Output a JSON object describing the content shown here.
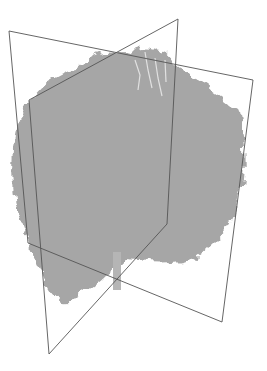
{
  "scene": {
    "description": "3D volume rendering of a tree canopy point cloud with two orthogonal intersecting slice planes",
    "background": "#ffffff",
    "foliage_color": "#9a9a9a",
    "foliage_light": "#d4d4d4",
    "foliage_dark": "#6e6e6e",
    "plane_stroke": "#555555",
    "planes": [
      {
        "name": "plane-a",
        "corners": [
          [
            9,
            31
          ],
          [
            253,
            80
          ],
          [
            222,
            322
          ],
          [
            28,
            243
          ]
        ]
      },
      {
        "name": "plane-b",
        "corners": [
          [
            29,
            100
          ],
          [
            178,
            19
          ],
          [
            167,
            224
          ],
          [
            49,
            354
          ]
        ]
      }
    ]
  }
}
